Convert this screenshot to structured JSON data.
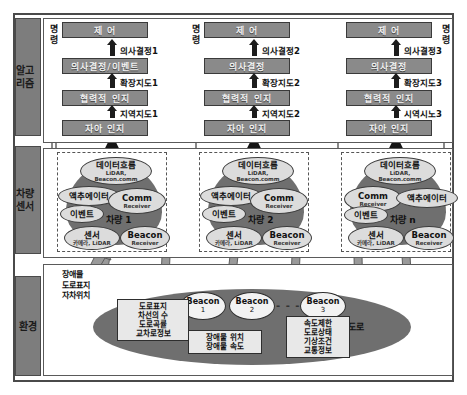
{
  "sidebar": {
    "items": [
      {
        "name": "algorithm",
        "label": "알고리즘"
      },
      {
        "name": "vehicle-sensor",
        "label": "차량센서"
      },
      {
        "name": "environment",
        "label": "환경"
      }
    ]
  },
  "algorithm": {
    "command_label": "명령",
    "columns": [
      {
        "control": "제  어",
        "decision": "의사결정/이벤트",
        "cooperative": "협력적 인지",
        "ego": "자아 인지",
        "edge_decision": "의사결정1",
        "edge_extended_map": "확장지도1",
        "edge_local_map": "지역지도1"
      },
      {
        "control": "제  어",
        "decision": "의사결정",
        "cooperative": "협력적 인지",
        "ego": "자아 인지",
        "edge_decision": "의사결정2",
        "edge_extended_map": "확장지도2",
        "edge_local_map": "지역지도2"
      },
      {
        "control": "제  어",
        "decision": "의사결정",
        "cooperative": "협력적 인지",
        "ego": "자아 인지",
        "edge_decision": "의사결정3",
        "edge_extended_map": "확장지도3",
        "edge_local_map": "시역시노3"
      }
    ]
  },
  "vehicles": [
    {
      "name": "차량 1",
      "dataflow_title": "데이터흐름",
      "dataflow_sub1": "LiDAR,",
      "dataflow_sub2": "Beacon.comm",
      "actuator": "액추에이터",
      "event": "이벤트",
      "comm_title": "Comm",
      "comm_sub": "Receiver",
      "sensor_title": "센서",
      "sensor_sub": "카메라, LiDAR",
      "beacon_title": "Beacon",
      "beacon_sub": "Receiver",
      "mirrored": false
    },
    {
      "name": "차량 2",
      "dataflow_title": "데이터흐름",
      "dataflow_sub1": "LiDAR,",
      "dataflow_sub2": "Beacon.comm",
      "actuator": "액추에이터",
      "event": "이벤트",
      "comm_title": "Comm",
      "comm_sub": "Receiver",
      "sensor_title": "센서",
      "sensor_sub": "카메라, LiDAR",
      "beacon_title": "Beacon",
      "beacon_sub": "Receiver",
      "mirrored": false
    },
    {
      "name": "차량 n",
      "dataflow_title": "데이터흐름",
      "dataflow_sub1": "LiDAR,",
      "dataflow_sub2": "Beacon.comm",
      "actuator": "액추에이터",
      "event": "이벤트",
      "comm_title": "Comm",
      "comm_sub": "Receiver",
      "sensor_title": "센서",
      "sensor_sub": "카메라, LiDAR",
      "beacon_title": "Beacon",
      "beacon_sub": "Receiver",
      "mirrored": true
    }
  ],
  "environment": {
    "sensing_text": "장애물\n도로표지\n자차위치",
    "road_label": "도로",
    "ellipsis": "- - -",
    "road_info": "도로표지\n차선의 수\n도로곡률\n교차로정보",
    "obstacle_info": "장애물 위치\n장애물 속도",
    "traffic_info": "속도제한\n도로상태\n기상조건\n교통정보",
    "beacons": [
      {
        "title": "Beacon",
        "num": "1"
      },
      {
        "title": "Beacon",
        "num": "2"
      },
      {
        "title": "Beacon",
        "num": "3"
      }
    ]
  },
  "colors": {
    "box_fill": "#8a8a8a",
    "blob_fill": "#6f6f6f",
    "band_arrow": "#c9c9c9",
    "thick_arrow": "#9a9a9a",
    "sidebar_fill": "#7d7d7d"
  }
}
